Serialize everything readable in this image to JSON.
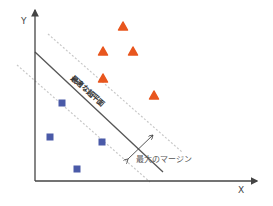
{
  "axes": {
    "x_label": "X",
    "y_label": "Y"
  },
  "labels": {
    "hyperplane": "最適な超平面",
    "margin": "最大のマージン"
  },
  "colors": {
    "triangle": "#e8561e",
    "square": "#4a5aa8",
    "axis": "#444444",
    "hyperplane": "#555555",
    "margin_line": "#c8c8c8"
  },
  "classes": [
    {
      "name": "triangles",
      "shape": "triangle",
      "points": [
        [
          123,
          27
        ],
        [
          103,
          52
        ],
        [
          133,
          52
        ],
        [
          103,
          79
        ],
        [
          154,
          96
        ]
      ]
    },
    {
      "name": "squares",
      "shape": "square",
      "points": [
        [
          62,
          103
        ],
        [
          50,
          137
        ],
        [
          102,
          142
        ],
        [
          77,
          169
        ]
      ]
    }
  ]
}
